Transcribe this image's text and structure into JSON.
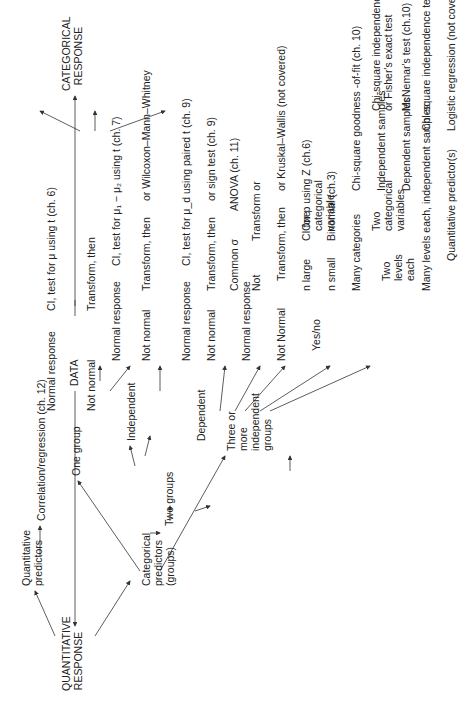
{
  "root": "DATA",
  "quantitative": {
    "label": "QUANTITATIVE RESPONSE",
    "quant_predictors": {
      "label": "Quantitative predictors",
      "result": "Correlation/regression (ch. 12)"
    },
    "cat_predictors": {
      "label": "Categorical predictors (groups)",
      "one_group": {
        "label": "One group",
        "normal": "Normal response",
        "normal_result": "CI, test for μ using t (ch. 6)",
        "not_normal": "Not normal",
        "transform": "Transform, then"
      },
      "two_groups": {
        "label": "Two groups",
        "independent": {
          "label": "Independent",
          "normal": "Normal response",
          "normal_result": "CI, test for μ₁ − μ₂ using t (ch. 7)",
          "not_normal": "Not normal",
          "transform": "Transform, then",
          "alt": "or  Wilcoxon–Mann–Whitney"
        },
        "dependent": {
          "label": "Dependent",
          "normal": "Normal response",
          "normal_result": "CI, test for μ_d using paired t (ch. 9)",
          "not_normal": "Not normal",
          "transform": "Transform, then",
          "alt": "or  sign test (ch. 9)"
        }
      },
      "three_plus": {
        "label": "Three or more independent groups",
        "normal": "Normal response",
        "common_sigma": "Common σ",
        "anova": "ANOVA (ch. 11)",
        "not": "Not",
        "transform_or": "Transform or",
        "not_normal": "Not Normal",
        "transform": "Transform, then",
        "alt": "or Kruskal–Wallis (not covered)"
      }
    }
  },
  "categorical": {
    "label": "CATEGORICAL RESPONSE",
    "one_var": {
      "label": "One categorical variable",
      "yes_no": "Yes/no",
      "n_large": "n large",
      "n_large_result": "CI for p using Z (ch.6)",
      "n_small": "n small",
      "n_small_result": "Binomial (ch.3)",
      "many": "Many categories",
      "many_result": "Chi-square goodness -of-fit (ch. 10)"
    },
    "two_var": {
      "label": "Two categorical variables",
      "two_levels": "Two levels each",
      "indep": "Independent samples",
      "indep_result": "Chi-square independence test for 2 × 2 (ch. 10)",
      "indep_result2": "or Fisher's exact test",
      "dep": "Dependent samples",
      "dep_result": "McNemar's test (ch.10)",
      "many": "Many levels each, independent samples",
      "many_result": "Chi-square independence test for r × k (ch. 10)"
    },
    "quant_pred": {
      "label": "Quantitative predictor(s)",
      "result": "Logistic regression (not covered)"
    }
  }
}
